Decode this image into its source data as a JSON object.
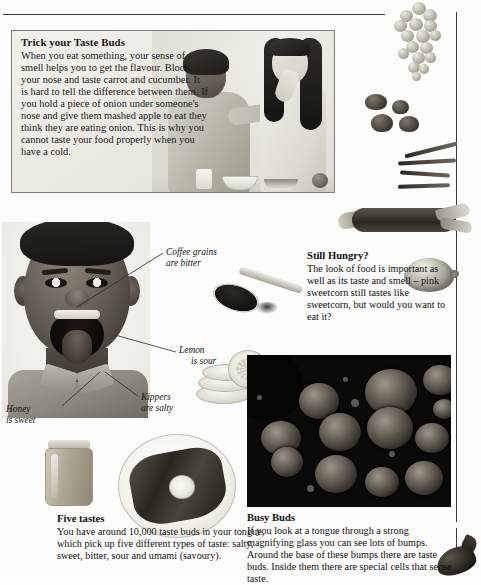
{
  "page": {
    "background_color": "#fcfcfa",
    "rule_color": "#3b3b3b"
  },
  "trick_panel": {
    "heading": "Trick your Taste Buds",
    "body": "When you eat something, your sense of smell helps you to get the flavour. Block your nose and taste carrot and cucumber. It is hard to tell the difference between them. If you hold a piece of onion under someone's nose and give them mashed apple to eat they think they are eating onion. This is why you cannot taste your food properly when you have a cold.",
    "photo_alt": "boy-and-girl-tasting-photo"
  },
  "still_hungry": {
    "heading": "Still Hungry?",
    "body": "The look of food is important as well as its taste and smell – pink sweetcorn still tastes like sweetcorn, but would you want to eat it?"
  },
  "busy_buds": {
    "heading": "Busy Buds",
    "body": "If you look at a tongue through a strong magnifying glass you can see lots of bumps. Around the base of these bumps there are taste buds. Inside them there are special cells that sense taste.",
    "image_alt": "tongue-taste-buds-micrograph"
  },
  "five_tastes": {
    "heading": "Five tastes",
    "body": "You have around 10,000 taste buds in your tongue, which pick up five different types of taste: salty, sweet, bitter, sour and umami (savoury)."
  },
  "captions": [
    {
      "id": "coffee",
      "line1": "Coffee grains",
      "line2": "are bitter"
    },
    {
      "id": "lemon",
      "line1": "Lemon",
      "line2": "is sour"
    },
    {
      "id": "kippers",
      "line1": "Kippers",
      "line2": "are salty"
    },
    {
      "id": "honey",
      "line1": "Honey",
      "line2": "is sweet"
    }
  ],
  "photos": [
    {
      "id": "face",
      "alt": "boy-open-mouth-tongue-photo"
    },
    {
      "id": "spoon",
      "alt": "spoon-of-coffee-grains-photo"
    },
    {
      "id": "lemon-slices",
      "alt": "lemon-slices-photo"
    },
    {
      "id": "honey-jar",
      "alt": "honey-jar-photo"
    },
    {
      "id": "kipper-plate",
      "alt": "kippers-on-plate-with-lemon-photo"
    },
    {
      "id": "grapes",
      "alt": "bunch-of-grapes-photo"
    },
    {
      "id": "mushrooms",
      "alt": "mushrooms-photo"
    },
    {
      "id": "beans",
      "alt": "green-beans-photo"
    },
    {
      "id": "corn",
      "alt": "sweetcorn-cob-photo"
    },
    {
      "id": "lemon-whole",
      "alt": "whole-lemon-photo"
    },
    {
      "id": "aubergine",
      "alt": "aubergine-photo"
    }
  ]
}
